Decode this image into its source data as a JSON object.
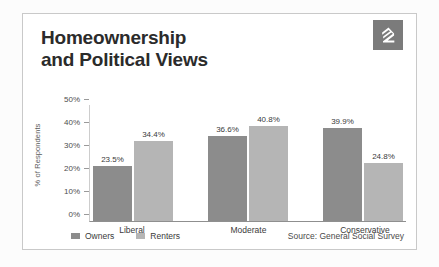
{
  "card": {
    "title_line1": "Homeownership",
    "title_line2": "and Political Views",
    "logo_name": "zillow-z-logo"
  },
  "chart_data": {
    "type": "bar",
    "title": "Homeownership and Political Views",
    "categories": [
      "Liberal",
      "Moderate",
      "Conservative"
    ],
    "series": [
      {
        "name": "Owners",
        "color": "#8c8c8c",
        "values": [
          23.5,
          36.6,
          39.9
        ]
      },
      {
        "name": "Renters",
        "color": "#b5b5b5",
        "values": [
          34.4,
          40.8,
          24.8
        ]
      }
    ],
    "value_labels": [
      "23.5%",
      "34.4%",
      "36.6%",
      "40.8%",
      "39.9%",
      "24.8%"
    ],
    "xlabel": "",
    "ylabel": "% of Respondents",
    "ylim": [
      0,
      50
    ],
    "yticks": [
      0,
      10,
      20,
      30,
      40,
      50
    ],
    "ytick_labels": [
      "0%",
      "10%",
      "20%",
      "30%",
      "40%",
      "50%"
    ],
    "grid": false,
    "legend_position": "bottom-left",
    "source": "Source: General Social Survey"
  },
  "footer": {
    "legend": [
      {
        "label": "Owners"
      },
      {
        "label": "Renters"
      }
    ],
    "source": "Source: General Social Survey"
  }
}
